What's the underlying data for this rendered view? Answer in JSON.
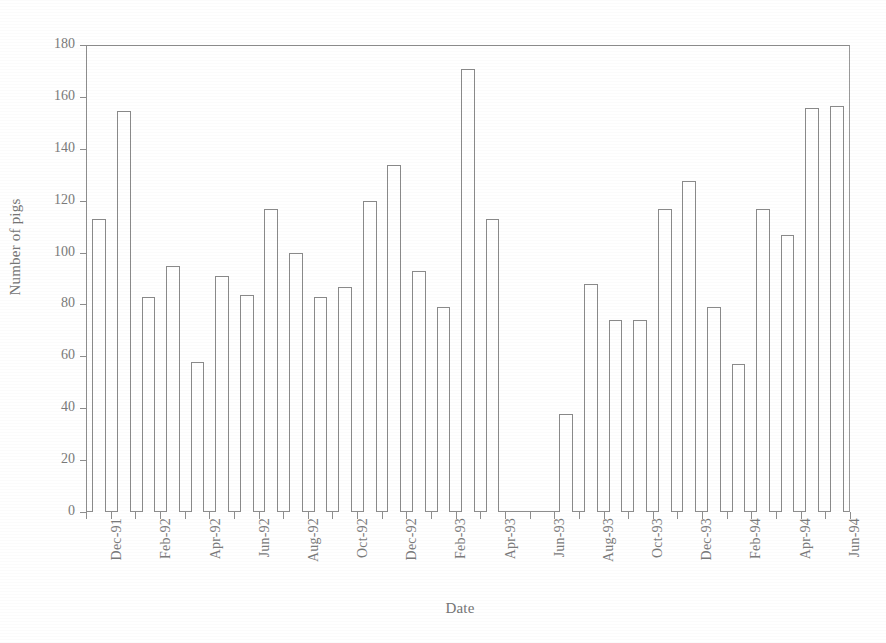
{
  "chart_data": {
    "type": "bar",
    "title": "",
    "xlabel": "Date",
    "ylabel": "Number of pigs",
    "ylim": [
      0,
      180
    ],
    "ytick_step": 20,
    "yticks": [
      0,
      20,
      40,
      60,
      80,
      100,
      120,
      140,
      160,
      180
    ],
    "grid": false,
    "legend": null,
    "bar_style": {
      "fill": "#ffffff",
      "edge": "#8a8a8a"
    },
    "categories": [
      "Dec-91",
      "Jan-92",
      "Feb-92",
      "Mar-92",
      "Apr-92",
      "May-92",
      "Jun-92",
      "Jul-92",
      "Aug-92",
      "Sep-92",
      "Oct-92",
      "Nov-92",
      "Dec-92",
      "Jan-93",
      "Feb-93",
      "Mar-93",
      "Apr-93",
      "May-93",
      "Jun-93",
      "Jul-93",
      "Aug-93",
      "Sep-93",
      "Oct-93",
      "Nov-93",
      "Dec-93",
      "Jan-94",
      "Feb-94",
      "Mar-94",
      "Apr-94",
      "May-94",
      "Jun-94"
    ],
    "values": [
      113,
      155,
      83,
      95,
      58,
      91,
      84,
      117,
      100,
      83,
      87,
      120,
      134,
      93,
      79,
      171,
      113,
      0,
      0,
      38,
      88,
      74,
      74,
      117,
      128,
      79,
      57,
      117,
      107,
      156,
      157
    ],
    "tick_labels": [
      "Dec-91",
      "Feb-92",
      "Apr-92",
      "Jun-92",
      "Aug-92",
      "Oct-92",
      "Dec-92",
      "Feb-93",
      "Apr-93",
      "Jun-93",
      "Aug-93",
      "Oct-93",
      "Dec-93",
      "Feb-94",
      "Apr-94",
      "Jun-94"
    ],
    "tick_label_indices": [
      0,
      2,
      4,
      6,
      8,
      10,
      12,
      14,
      16,
      18,
      20,
      22,
      24,
      26,
      28,
      30
    ]
  },
  "colors": {
    "axis": "#8d8d8d",
    "text": "#757575",
    "bar_edge": "#8a8a8a",
    "background": "#ffffff"
  }
}
